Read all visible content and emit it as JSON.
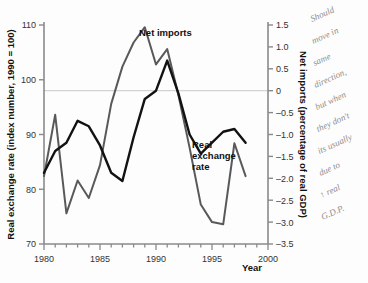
{
  "chart_data": {
    "type": "line",
    "title": "",
    "xlabel": "Year",
    "ylabel_left": "Real exchange rate (index number, 1990 = 100)",
    "ylabel_right": "Net imports (percentage of real GDP)",
    "x": [
      1980,
      1981,
      1982,
      1983,
      1984,
      1985,
      1986,
      1987,
      1988,
      1989,
      1990,
      1991,
      1992,
      1993,
      1994,
      1995,
      1996,
      1997,
      1998
    ],
    "xlim": [
      1980,
      2000
    ],
    "xticks": [
      1980,
      1985,
      1990,
      1995,
      2000
    ],
    "xticklabels": [
      "1980",
      "1985",
      "1990",
      "1995",
      "2000"
    ],
    "ylim_left": [
      70,
      110
    ],
    "yticks_left": [
      70,
      80,
      90,
      100,
      110
    ],
    "yticklabels_left": [
      "70",
      "80",
      "90",
      "100",
      "110"
    ],
    "ylim_right": [
      -3.5,
      1.5
    ],
    "yticks_right": [
      1.5,
      1.0,
      0.5,
      0,
      -0.5,
      -1.0,
      -1.5,
      -2.0,
      -2.5,
      -3.0,
      -3.5
    ],
    "yticklabels_right": [
      "1.5",
      "1.0",
      "0.5",
      "0",
      "–0.5",
      "–1.0",
      "–1.5",
      "–2.0",
      "–2.5",
      "–3.0",
      "–3.5"
    ],
    "gridline_at_zero": true,
    "legend_position": "inline-annotation",
    "series": [
      {
        "name": "Net imports",
        "axis": "right",
        "color": "#59595b",
        "values": [
          -1.95,
          -0.55,
          -2.8,
          -2.05,
          -2.45,
          -1.7,
          -0.3,
          0.55,
          1.1,
          1.45,
          0.6,
          0.95,
          -0.1,
          -1.3,
          -2.6,
          -3.0,
          -3.05,
          -1.2,
          -1.95
        ]
      },
      {
        "name": "Real exchange rate",
        "axis": "left",
        "color": "#121212",
        "values": [
          83.0,
          87.0,
          88.5,
          92.5,
          91.5,
          88.0,
          83.0,
          81.5,
          89.5,
          96.5,
          98.0,
          103.5,
          97.5,
          90.0,
          86.5,
          88.5,
          90.5,
          91.0,
          88.5
        ]
      }
    ],
    "annotations": [
      {
        "name": "net-imports-label",
        "text": "Net imports",
        "x_px": 139,
        "y_px": 36
      },
      {
        "name": "real-exchange-rate-label",
        "lines": [
          "Real",
          "exchange",
          "rate"
        ],
        "x_px": 192,
        "y_px": 148
      }
    ]
  },
  "handwriting": {
    "lines": [
      "Should",
      "move in",
      "same",
      "direction,",
      "but when",
      "they don't",
      "its usually",
      "due to",
      "↑ real",
      "G.D.P."
    ]
  },
  "colors": {
    "net_imports": "#59595b",
    "real_exchange_rate": "#121212",
    "axis": "#8a8a8a",
    "zero_gridline": "#c9c9c9",
    "handwriting": "#8d8d8d",
    "background": "#ffffff"
  }
}
